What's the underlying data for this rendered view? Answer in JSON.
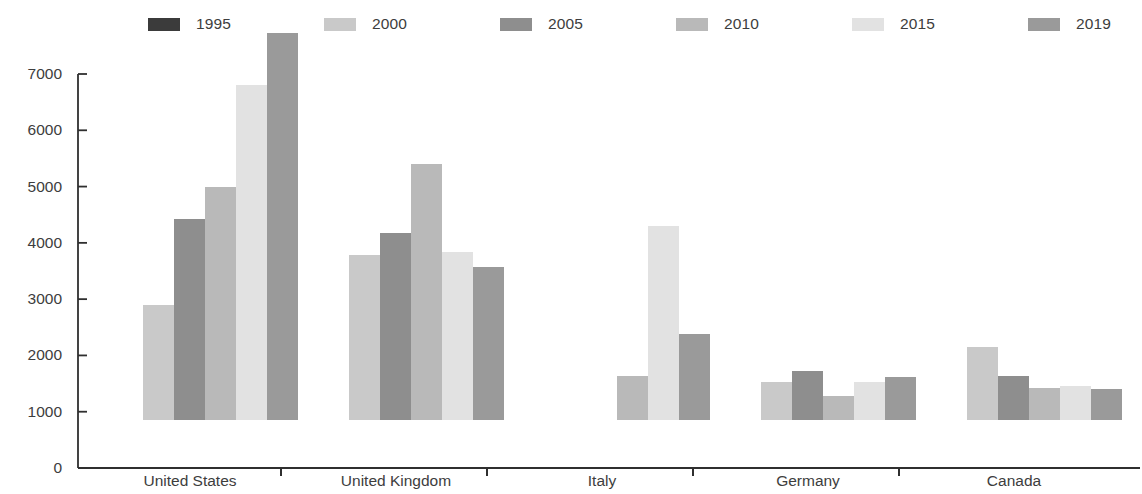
{
  "chart_data": {
    "type": "bar",
    "title": "",
    "subtitle": "",
    "xlabel": "",
    "ylabel": "",
    "ylim": [
      0,
      7000
    ],
    "ytick_step": 1000,
    "yticks": [
      "0",
      "1000",
      "2000",
      "3000",
      "4000",
      "5000",
      "6000",
      "7000"
    ],
    "grid": false,
    "legend_position": "top",
    "categories": [
      "United States",
      "United Kingdom",
      "Italy",
      "Germany",
      "Canada"
    ],
    "series": [
      {
        "name": "1995",
        "color": "#3b3b3b",
        "values": [
          null,
          null,
          null,
          null,
          null
        ]
      },
      {
        "name": "2000",
        "color": "#c9c9c9",
        "values": [
          2040,
          2940,
          null,
          680,
          1300
        ]
      },
      {
        "name": "2005",
        "color": "#8e8e8e",
        "values": [
          3580,
          3320,
          null,
          870,
          780
        ]
      },
      {
        "name": "2010",
        "color": "#b9b9b9",
        "values": [
          4140,
          4540,
          780,
          420,
          570
        ]
      },
      {
        "name": "2015",
        "color": "#e2e2e2",
        "values": [
          5950,
          2980,
          3450,
          670,
          600
        ]
      },
      {
        "name": "2019",
        "color": "#9a9a9a",
        "values": [
          6880,
          2710,
          1520,
          760,
          550
        ]
      }
    ]
  },
  "legend": {
    "items": [
      {
        "label": "1995",
        "color": "#3b3b3b",
        "x": 148
      },
      {
        "label": "2000",
        "color": "#c9c9c9",
        "x": 324
      },
      {
        "label": "2005",
        "color": "#8e8e8e",
        "x": 500
      },
      {
        "label": "2010",
        "color": "#b9b9b9",
        "x": 676
      },
      {
        "label": "2015",
        "color": "#e2e2e2",
        "x": 852
      },
      {
        "label": "2019",
        "color": "#9a9a9a",
        "x": 1028
      }
    ]
  },
  "axis": {
    "line_color": "#2f2f2f",
    "group_tick_positions": [
      281,
      487,
      693,
      899
    ]
  }
}
